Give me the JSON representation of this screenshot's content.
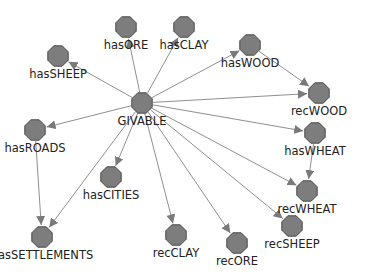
{
  "graph": {
    "title": "",
    "colors": {
      "node_fill": "#7d7d7d",
      "node_stroke": "#4a4a4a",
      "edge": "#8f8f8f",
      "label": "#222222",
      "background": "#ffffff"
    },
    "nodes": [
      {
        "id": "GIVABLE",
        "label": "GIVABLE",
        "x": 142,
        "y": 103
      },
      {
        "id": "hasORE",
        "label": "hasORE",
        "x": 126,
        "y": 27
      },
      {
        "id": "hasCLAY",
        "label": "hasCLAY",
        "x": 184,
        "y": 27
      },
      {
        "id": "hasSHEEP",
        "label": "hasSHEEP",
        "x": 58,
        "y": 56
      },
      {
        "id": "hasWOOD",
        "label": "hasWOOD",
        "x": 250,
        "y": 45
      },
      {
        "id": "recWOOD",
        "label": "recWOOD",
        "x": 319,
        "y": 93
      },
      {
        "id": "hasROADS",
        "label": "hasROADS",
        "x": 35,
        "y": 130
      },
      {
        "id": "hasWHEAT",
        "label": "hasWHEAT",
        "x": 315,
        "y": 133
      },
      {
        "id": "hasCITIES",
        "label": "hasCITIES",
        "x": 111,
        "y": 177
      },
      {
        "id": "recWHEAT",
        "label": "recWHEAT",
        "x": 307,
        "y": 191
      },
      {
        "id": "hasSETTLEMENTS",
        "label": "hasSETTLEMENTS",
        "x": 42,
        "y": 237
      },
      {
        "id": "recCLAY",
        "label": "recCLAY",
        "x": 176,
        "y": 235
      },
      {
        "id": "recORE",
        "label": "recORE",
        "x": 237,
        "y": 243
      },
      {
        "id": "recSHEEP",
        "label": "recSHEEP",
        "x": 292,
        "y": 226
      }
    ],
    "edges": [
      {
        "from": "GIVABLE",
        "to": "hasORE"
      },
      {
        "from": "GIVABLE",
        "to": "hasCLAY"
      },
      {
        "from": "GIVABLE",
        "to": "hasSHEEP"
      },
      {
        "from": "GIVABLE",
        "to": "hasWOOD"
      },
      {
        "from": "GIVABLE",
        "to": "recWOOD"
      },
      {
        "from": "GIVABLE",
        "to": "hasWHEAT"
      },
      {
        "from": "GIVABLE",
        "to": "hasROADS"
      },
      {
        "from": "GIVABLE",
        "to": "hasCITIES"
      },
      {
        "from": "GIVABLE",
        "to": "hasSETTLEMENTS"
      },
      {
        "from": "GIVABLE",
        "to": "recCLAY"
      },
      {
        "from": "GIVABLE",
        "to": "recORE"
      },
      {
        "from": "GIVABLE",
        "to": "recSHEEP"
      },
      {
        "from": "GIVABLE",
        "to": "recWHEAT"
      },
      {
        "from": "hasWOOD",
        "to": "recWOOD"
      },
      {
        "from": "hasWHEAT",
        "to": "recWHEAT"
      },
      {
        "from": "hasROADS",
        "to": "hasSETTLEMENTS"
      }
    ]
  }
}
